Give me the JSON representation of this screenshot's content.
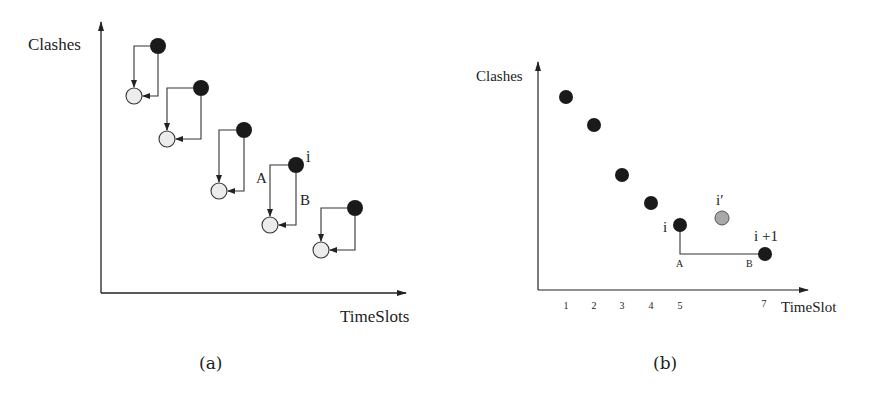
{
  "panel_a": {
    "caption": "(a)",
    "ylabel": "Clashes",
    "xlabel": "TimeSlots",
    "label_i": "i",
    "label_A": "A",
    "label_B": "B",
    "pairs": [
      {
        "filled": [
          158,
          46
        ],
        "empty": [
          134,
          96
        ]
      },
      {
        "filled": [
          201,
          88
        ],
        "empty": [
          167,
          139
        ]
      },
      {
        "filled": [
          244,
          130
        ],
        "empty": [
          219,
          191
        ]
      },
      {
        "filled": [
          296,
          165
        ],
        "empty": [
          270,
          225
        ]
      },
      {
        "filled": [
          355,
          208
        ],
        "empty": [
          321,
          250
        ]
      }
    ]
  },
  "panel_b": {
    "caption": "(b)",
    "ylabel": "Clashes",
    "xlabel": "TimeSlot",
    "label_i": "i",
    "label_i_prime": "i′",
    "label_i_plus_1": "i +1",
    "label_A": "A",
    "label_B": "B",
    "ticks": [
      "1",
      "2",
      "3",
      "4",
      "5",
      "7"
    ],
    "colors": {
      "filled": "#1a1a1a",
      "candidate": "#a8a8a8"
    }
  },
  "chart_data": {
    "type": "scatter",
    "title": "",
    "xlabel": "TimeSlot",
    "ylabel": "Clashes",
    "series": [
      {
        "name": "solutions",
        "x": [
          1,
          2,
          3,
          4,
          5,
          7
        ],
        "y": [
          6.8,
          5.8,
          4.1,
          3.1,
          2.3,
          1.3
        ]
      },
      {
        "name": "i'",
        "x": [
          6
        ],
        "y": [
          2.5
        ]
      }
    ],
    "annotations": [
      "i at x=5",
      "i' gray candidate near x=6",
      "i+1 at x=7",
      "A at (5, 1.3)",
      "B at (7, 1.3)"
    ],
    "grid": false
  }
}
